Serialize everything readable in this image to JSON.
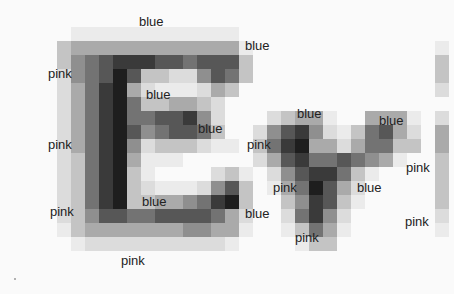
{
  "image": {
    "description": "Pixelated grayscale rendering of the letters 'E' and 'y' (and a partial third letter) with color-word labels overlaid",
    "cell_size": 14,
    "origin": [
      57,
      27
    ],
    "levels": [
      "#fafafa",
      "#ebebeb",
      "#dcdcdc",
      "#c4c4c4",
      "#aaaaaa",
      "#8f8f8f",
      "#737373",
      "#575757",
      "#3a3a3a",
      "#1e1e1e"
    ],
    "rows": [
      "0111111111111000000000000000",
      "3444444444444100000000000001",
      "3567888776777300000000000003",
      "2567973322576300000000000003",
      "2468942111243000000000000002",
      "2468963344320000000000000000",
      "2468966778520002344100444102",
      "2468975677630025785213674204",
      "2468952333211036894424663304",
      "2368941110000024786676541003",
      "2368931000023102578863100003",
      "2368932111257301469742000003",
      "2368933445689300358731000003",
      "2357766777764200268520000002",
      "1344444445544100136410000001",
      "0122222222221000013300000000",
      "0000000000000000000000000000"
    ]
  },
  "labels": [
    {
      "text": "blue",
      "x": 139,
      "y": 22
    },
    {
      "text": "blue",
      "x": 245,
      "y": 46
    },
    {
      "text": "pink",
      "x": 48,
      "y": 74
    },
    {
      "text": "blue",
      "x": 146,
      "y": 95
    },
    {
      "text": "blue",
      "x": 198,
      "y": 129
    },
    {
      "text": "blue",
      "x": 297,
      "y": 114
    },
    {
      "text": "blue",
      "x": 379,
      "y": 121
    },
    {
      "text": "pink",
      "x": 48,
      "y": 145
    },
    {
      "text": "pink",
      "x": 247,
      "y": 145
    },
    {
      "text": "pink",
      "x": 406,
      "y": 168
    },
    {
      "text": "pink",
      "x": 273,
      "y": 188
    },
    {
      "text": "blue",
      "x": 357,
      "y": 188
    },
    {
      "text": "blue",
      "x": 142,
      "y": 202
    },
    {
      "text": "pink",
      "x": 50,
      "y": 212
    },
    {
      "text": "blue",
      "x": 245,
      "y": 214
    },
    {
      "text": "pink",
      "x": 405,
      "y": 222
    },
    {
      "text": "pink",
      "x": 295,
      "y": 238
    },
    {
      "text": "pink",
      "x": 121,
      "y": 261
    }
  ],
  "artifact_dot": {
    "x": 14,
    "y": 278
  }
}
